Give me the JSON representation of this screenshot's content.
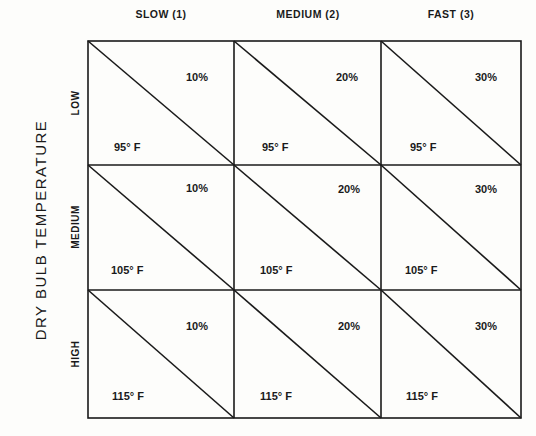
{
  "diagram": {
    "y_axis_title": "DRY BULB TEMPERATURE",
    "columns": [
      {
        "label": "SLOW (1)"
      },
      {
        "label": "MEDIUM (2)"
      },
      {
        "label": "FAST (3)"
      }
    ],
    "rows": [
      {
        "label": "LOW"
      },
      {
        "label": "MEDIUM"
      },
      {
        "label": "HIGH"
      }
    ],
    "cells": [
      [
        {
          "percent": "10%",
          "temp": "95° F"
        },
        {
          "percent": "20%",
          "temp": "95° F"
        },
        {
          "percent": "30%",
          "temp": "95° F"
        }
      ],
      [
        {
          "percent": "10%",
          "temp": "105° F"
        },
        {
          "percent": "20%",
          "temp": "105° F"
        },
        {
          "percent": "30%",
          "temp": "105° F"
        }
      ],
      [
        {
          "percent": "10%",
          "temp": "115° F"
        },
        {
          "percent": "20%",
          "temp": "115° F"
        },
        {
          "percent": "30%",
          "temp": "115° F"
        }
      ]
    ],
    "line_color": "#1a1a1a"
  }
}
